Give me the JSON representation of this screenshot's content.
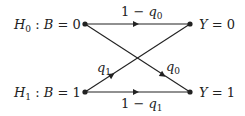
{
  "diagram": {
    "inputs": [
      {
        "hyp": "H",
        "hyp_sub": "0",
        "sep": ":",
        "var": "B",
        "eq": "= 0"
      },
      {
        "hyp": "H",
        "hyp_sub": "1",
        "sep": ":",
        "var": "B",
        "eq": "= 1"
      }
    ],
    "outputs": [
      {
        "var": "Y",
        "eq": "= 0"
      },
      {
        "var": "Y",
        "eq": "= 1"
      }
    ],
    "edges": [
      {
        "from": "B=0",
        "to": "Y=0",
        "label_pre": "1 − ",
        "label_var": "q",
        "label_sub": "0"
      },
      {
        "from": "B=0",
        "to": "Y=1",
        "label_pre": "",
        "label_var": "q",
        "label_sub": "0"
      },
      {
        "from": "B=1",
        "to": "Y=0",
        "label_pre": "",
        "label_var": "q",
        "label_sub": "1"
      },
      {
        "from": "B=1",
        "to": "Y=1",
        "label_pre": "1 − ",
        "label_var": "q",
        "label_sub": "1"
      }
    ],
    "colors": {
      "line": "#222222",
      "background": "#ffffff"
    }
  }
}
